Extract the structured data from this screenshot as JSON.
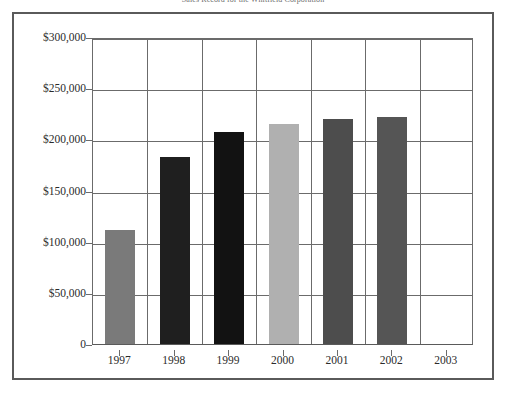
{
  "chart_data": {
    "type": "bar",
    "title": "Sales Record for the Whitfield Corporation",
    "xlabel": "",
    "ylabel": "",
    "categories": [
      "1997",
      "1998",
      "1999",
      "2000",
      "2001",
      "2002",
      "2003"
    ],
    "values": [
      111000,
      183000,
      207000,
      215000,
      220000,
      222000,
      null
    ],
    "ylim": [
      0,
      300000
    ],
    "ytick_values": [
      0,
      50000,
      100000,
      150000,
      200000,
      250000,
      300000
    ],
    "ytick_labels": [
      "0",
      "$50,000",
      "$100,000",
      "$150,000",
      "$200,000",
      "$250,000",
      "$300,000"
    ],
    "grid": true,
    "legend": false,
    "bar_colors": [
      "#7a7a7a",
      "#1f1f1f",
      "#121212",
      "#b0b0b0",
      "#4d4d4d",
      "#555555",
      null
    ],
    "axis_color": "#6b6b6b",
    "frame_color": "#5a5a5a",
    "background": "#ffffff"
  }
}
